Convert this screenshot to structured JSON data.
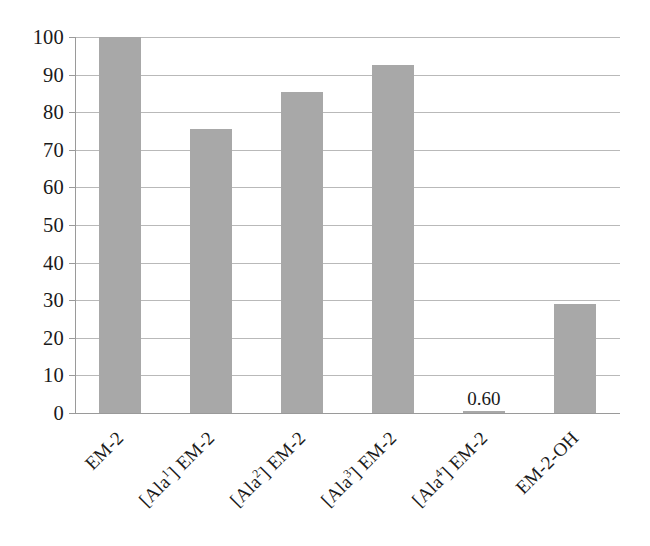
{
  "chart_data": {
    "type": "bar",
    "title": "",
    "xlabel": "",
    "ylabel": "",
    "categories": [
      "EM-2",
      "[Ala1] EM-2",
      "[Ala2] EM-2",
      "[Ala3] EM-2",
      "[Ala4] EM-2",
      "EM-2-OH"
    ],
    "category_parts": [
      {
        "pre": "EM-2",
        "sup": "",
        "post": ""
      },
      {
        "pre": "[Ala",
        "sup": "1",
        "post": "] EM-2"
      },
      {
        "pre": "[Ala",
        "sup": "2",
        "post": "] EM-2"
      },
      {
        "pre": "[Ala",
        "sup": "3",
        "post": "] EM-2"
      },
      {
        "pre": "[Ala",
        "sup": "4",
        "post": "] EM-2"
      },
      {
        "pre": "EM-2-OH",
        "sup": "",
        "post": ""
      }
    ],
    "values": [
      100,
      75.5,
      85.5,
      92.5,
      0.6,
      29
    ],
    "data_labels": [
      "",
      "",
      "",
      "",
      "0.60",
      ""
    ],
    "ylim": [
      0,
      100
    ],
    "ytick_labels": [
      "100",
      "90",
      "80",
      "70",
      "60",
      "50",
      "40",
      "30",
      "20",
      "10",
      "0"
    ],
    "ytick_values": [
      100,
      90,
      80,
      70,
      60,
      50,
      40,
      30,
      20,
      10,
      0
    ],
    "grid": true,
    "legend": "none",
    "bar_color": "#a8a8a8",
    "gridline_color": "#b9b9b9",
    "axis_color": "#9a9a9a",
    "background_color": "#ffffff",
    "text_color": "#1a1a1a"
  }
}
